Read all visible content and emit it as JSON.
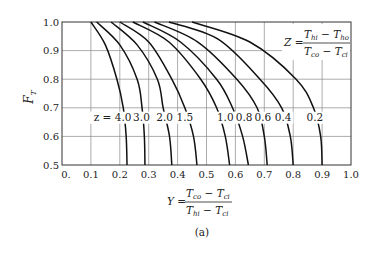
{
  "chart_data": {
    "type": "line",
    "title": "",
    "xlabel": "Y = (T_co - T_ci) / (T_hi - T_ci)",
    "ylabel": "F_T",
    "xlim": [
      0,
      1.0
    ],
    "ylim": [
      0.5,
      1.0
    ],
    "grid": true,
    "x_ticks": [
      "0.",
      "0.1",
      "0.2",
      "0.3",
      "0.4",
      "0.5",
      "0.6",
      "0.7",
      "0.8",
      "0.9",
      "1.0"
    ],
    "y_ticks": [
      "0.5",
      "0.6",
      "0.7",
      "0.8",
      "0.9",
      "1.0"
    ],
    "annotation": "Z = (T_hi - T_ho) / (T_co - T_ci)",
    "curve_label_prefix": "z =",
    "series": [
      {
        "name": "4.0",
        "x": [
          0.1,
          0.15,
          0.19,
          0.212,
          0.222,
          0.225
        ],
        "y": [
          1.0,
          0.92,
          0.8,
          0.7,
          0.6,
          0.5
        ]
      },
      {
        "name": "3.0",
        "x": [
          0.12,
          0.2,
          0.26,
          0.277,
          0.285,
          0.287
        ],
        "y": [
          1.0,
          0.92,
          0.8,
          0.7,
          0.6,
          0.5
        ]
      },
      {
        "name": "2.0",
        "x": [
          0.17,
          0.26,
          0.33,
          0.35,
          0.372,
          0.38
        ],
        "y": [
          1.0,
          0.92,
          0.8,
          0.7,
          0.6,
          0.5
        ]
      },
      {
        "name": "1.5",
        "x": [
          0.2,
          0.3,
          0.38,
          0.425,
          0.455,
          0.467
        ],
        "y": [
          1.0,
          0.93,
          0.8,
          0.7,
          0.6,
          0.5
        ]
      },
      {
        "name": "1.0",
        "x": [
          0.245,
          0.37,
          0.48,
          0.535,
          0.565,
          0.58
        ],
        "y": [
          1.0,
          0.93,
          0.8,
          0.7,
          0.6,
          0.5
        ]
      },
      {
        "name": "0.8",
        "x": [
          0.28,
          0.41,
          0.535,
          0.59,
          0.625,
          0.645
        ],
        "y": [
          1.0,
          0.93,
          0.8,
          0.7,
          0.6,
          0.5
        ]
      },
      {
        "name": "0.6",
        "x": [
          0.32,
          0.47,
          0.605,
          0.675,
          0.7,
          0.71
        ],
        "y": [
          1.0,
          0.93,
          0.8,
          0.7,
          0.6,
          0.5
        ]
      },
      {
        "name": "0.4",
        "x": [
          0.37,
          0.54,
          0.685,
          0.76,
          0.79,
          0.8
        ],
        "y": [
          1.0,
          0.94,
          0.8,
          0.7,
          0.6,
          0.5
        ]
      },
      {
        "name": "0.2",
        "x": [
          0.45,
          0.65,
          0.81,
          0.87,
          0.895,
          0.9
        ],
        "y": [
          1.0,
          0.93,
          0.8,
          0.7,
          0.6,
          0.5
        ]
      }
    ],
    "curve_labels": [
      {
        "text": "z = 4.0",
        "x": 0.175
      },
      {
        "text": "3.0",
        "x": 0.275
      },
      {
        "text": "2.0",
        "x": 0.355
      },
      {
        "text": "1.5",
        "x": 0.425
      },
      {
        "text": "1.0",
        "x": 0.565
      },
      {
        "text": "0.8",
        "x": 0.63
      },
      {
        "text": "0.6",
        "x": 0.695
      },
      {
        "text": "0.4",
        "x": 0.765
      },
      {
        "text": "0.2",
        "x": 0.875
      }
    ]
  },
  "labels": {
    "y_axis_main": "F",
    "y_axis_sub": "T",
    "z_eq": "Z =",
    "z_num": "T",
    "z_num_sub1": "hi",
    "z_num_mid": " − T",
    "z_num_sub2": "ho",
    "z_den": "T",
    "z_den_sub1": "co",
    "z_den_mid": " − T",
    "z_den_sub2": "ci",
    "y_eq": "Y =",
    "y_num": "T",
    "y_num_sub1": "co",
    "y_num_mid": " − T",
    "y_num_sub2": "ci",
    "y_den": "T",
    "y_den_sub1": "hi",
    "y_den_mid": " − T",
    "y_den_sub2": "ci",
    "caption": "(a)"
  }
}
